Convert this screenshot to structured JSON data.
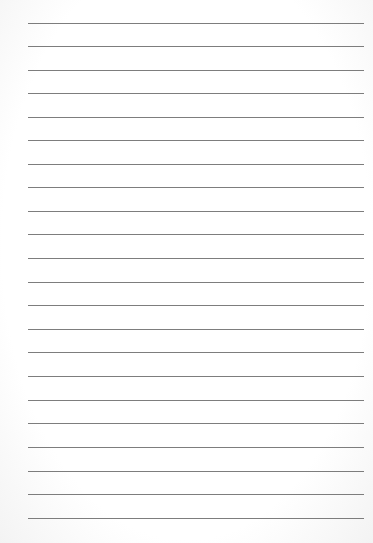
{
  "page": {
    "type": "lined-paper",
    "background_color": "#ffffff",
    "line_color": "#6f6f6f",
    "line_count": 22,
    "line_left": 28,
    "line_right": 364,
    "line_positions": [
      23,
      46,
      70,
      93,
      117,
      140,
      164,
      187,
      211,
      234,
      258,
      282,
      305,
      329,
      352,
      376,
      400,
      423,
      447,
      471,
      494,
      518
    ]
  }
}
